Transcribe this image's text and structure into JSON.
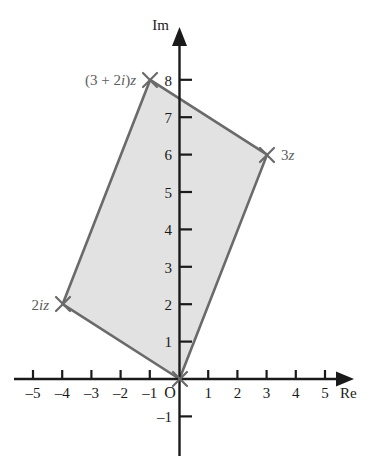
{
  "figure": {
    "background_color": "#ffffff",
    "axis_color": "#1a1a1a",
    "shape_stroke_color": "#6a6a6a",
    "shape_fill_color": "#e2e2e2",
    "label_color": "#5d5d5d"
  },
  "axes": {
    "x_axis_name": "Re",
    "y_axis_name": "Im",
    "origin_label": "O",
    "x_ticks": [
      "–5",
      "–4",
      "–3",
      "–2",
      "–1",
      "1",
      "2",
      "3",
      "4",
      "5"
    ],
    "y_ticks": [
      "–1",
      "1",
      "2",
      "3",
      "4",
      "5",
      "6",
      "7",
      "8"
    ]
  },
  "points": [
    {
      "label_html": "(3 + 2<i>i</i>)<i>z</i>",
      "label_plain": "(3 + 2i)z",
      "re": -1,
      "im": 8,
      "marker": "cross"
    },
    {
      "label_html": "3<i>z</i>",
      "label_plain": "3z",
      "re": 3,
      "im": 6,
      "marker": "cross"
    },
    {
      "label_html": "2<i>iz</i>",
      "label_plain": "2iz",
      "re": -4,
      "im": 2,
      "marker": "cross"
    },
    {
      "label_html": "",
      "label_plain": "O",
      "re": 0,
      "im": 0,
      "marker": "cross"
    }
  ],
  "chart_data": {
    "type": "scatter",
    "xlabel": "Re",
    "ylabel": "Im",
    "xlim": [
      -5.8,
      5.9
    ],
    "ylim": [
      -1.8,
      9.1
    ],
    "grid": false,
    "legend": "none",
    "xticks": [
      -5,
      -4,
      -3,
      -2,
      -1,
      1,
      2,
      3,
      4,
      5
    ],
    "xticklabels": [
      "–5",
      "–4",
      "–3",
      "–2",
      "–1",
      "1",
      "2",
      "3",
      "4",
      "5"
    ],
    "yticks": [
      -1,
      1,
      2,
      3,
      4,
      5,
      6,
      7,
      8
    ],
    "yticklabels": [
      "–1",
      "1",
      "2",
      "3",
      "4",
      "5",
      "6",
      "7",
      "8"
    ],
    "series": [
      {
        "name": "parallelogram",
        "type": "polygon",
        "closed": true,
        "fill": "#e2e2e2",
        "stroke": "#6a6a6a",
        "points": [
          {
            "x": 0,
            "y": 0,
            "label": "O"
          },
          {
            "x": 3,
            "y": 6,
            "label": "3z"
          },
          {
            "x": -1,
            "y": 8,
            "label": "(3 + 2i)z"
          },
          {
            "x": -4,
            "y": 2,
            "label": "2iz"
          }
        ]
      },
      {
        "name": "marked points",
        "type": "scatter",
        "marker": "x",
        "points": [
          {
            "x": 0,
            "y": 0,
            "label": ""
          },
          {
            "x": 3,
            "y": 6,
            "label": "3z"
          },
          {
            "x": -1,
            "y": 8,
            "label": "(3 + 2i)z"
          },
          {
            "x": -4,
            "y": 2,
            "label": "2iz"
          }
        ]
      }
    ],
    "annotations": [
      {
        "text": "(3 + 2i)z",
        "x": -1,
        "y": 8,
        "anchor": "right-of-left"
      },
      {
        "text": "3z",
        "x": 3,
        "y": 6,
        "anchor": "right"
      },
      {
        "text": "2iz",
        "x": -4,
        "y": 2,
        "anchor": "left"
      },
      {
        "text": "O",
        "x": 0,
        "y": 0,
        "anchor": "lower-left"
      }
    ]
  }
}
